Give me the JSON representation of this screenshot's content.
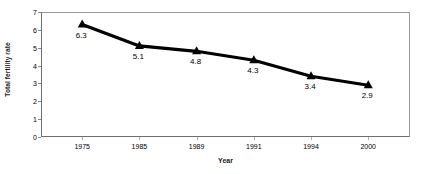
{
  "chart_data": {
    "type": "line",
    "title": "",
    "xlabel": "Year",
    "ylabel": "Total fertility rate",
    "categories": [
      "1975",
      "1985",
      "1989",
      "1991",
      "1994",
      "2000"
    ],
    "values": [
      6.3,
      5.1,
      4.8,
      4.3,
      3.4,
      2.9
    ],
    "point_labels": [
      "6.3",
      "5.1",
      "4.8",
      "4.3",
      "3.4",
      "2.9"
    ],
    "ylim": [
      0,
      7
    ],
    "y_ticks": [
      "0",
      "1",
      "2",
      "3",
      "4",
      "5",
      "6",
      "7"
    ],
    "grid": false,
    "legend": false,
    "marker": "triangle",
    "series": [
      {
        "name": "Total fertility rate",
        "values": [
          6.3,
          5.1,
          4.8,
          4.3,
          3.4,
          2.9
        ]
      }
    ],
    "colors": {
      "line": "#000000",
      "marker": "#000000",
      "frame": "#9a9a9a",
      "background": "#ffffff",
      "text": "#000000"
    }
  }
}
